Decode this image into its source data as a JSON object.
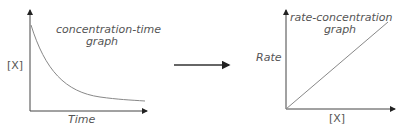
{
  "left_graph": {
    "title_line1": "concentration-time",
    "title_line2": "graph",
    "y_label": "[X]",
    "x_label": "Time",
    "curve": "exponential decay"
  },
  "arrow": {
    "direction": "right"
  },
  "right_graph": {
    "title_line1": "rate-concentration",
    "title_line2": "graph",
    "y_label": "Rate",
    "x_label": "[X]",
    "curve": "straight line through origin"
  },
  "colors": {
    "axis": "#333333",
    "curve": "#777777",
    "text": "#555555"
  }
}
